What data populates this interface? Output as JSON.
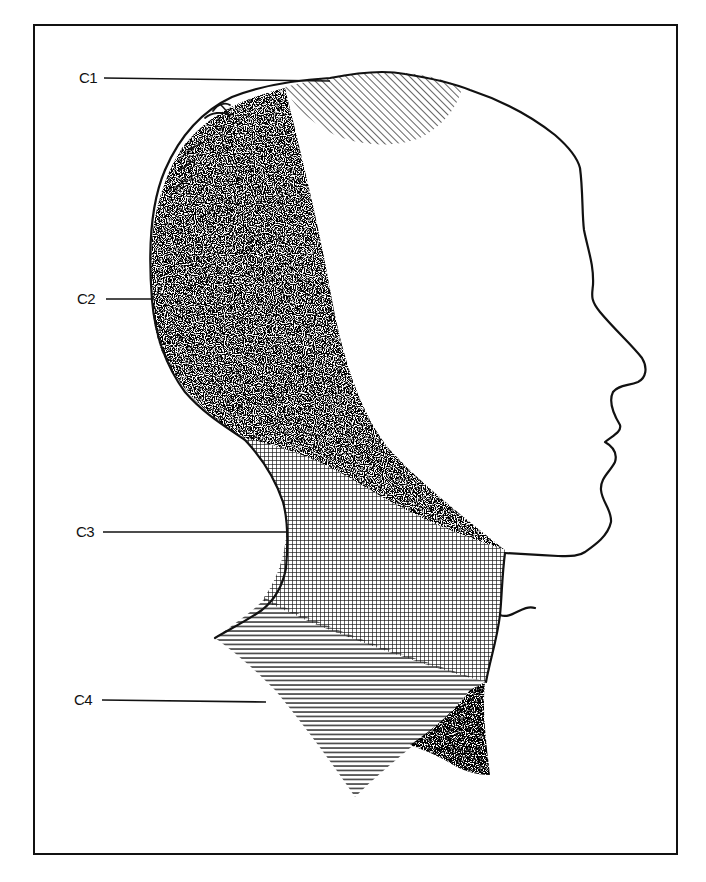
{
  "figure": {
    "type": "dermatome-diagram",
    "colors": {
      "ink": "#111111",
      "background": "#ffffff"
    },
    "regions": [
      {
        "id": "C1",
        "label": "C1",
        "fill": "diagonal-hatch",
        "location": "vertex of scalp"
      },
      {
        "id": "C2",
        "label": "C2",
        "fill": "stipple",
        "location": "occipital scalp, behind ear to angle of jaw"
      },
      {
        "id": "C3",
        "label": "C3",
        "fill": "cross-hatch",
        "location": "neck"
      },
      {
        "id": "C4",
        "label": "C4",
        "fill": "horizontal-hatch",
        "location": "lower neck and shoulder"
      }
    ]
  },
  "labels": {
    "c1": "C1",
    "c2": "C2",
    "c3": "C3",
    "c4": "C4"
  }
}
